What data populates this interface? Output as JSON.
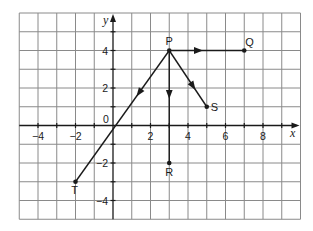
{
  "diagram": {
    "type": "coordinate-grid-vectors",
    "grid": {
      "x_min": -5,
      "x_max": 10,
      "y_min": -5,
      "y_max": 6,
      "step": 1
    },
    "axes": {
      "x_label": "x",
      "y_label": "y",
      "origin_label": "0",
      "x_tick_labels": [
        {
          "value": -4,
          "text": "−4"
        },
        {
          "value": -2,
          "text": "−2"
        },
        {
          "value": 2,
          "text": "2"
        },
        {
          "value": 4,
          "text": "4"
        },
        {
          "value": 6,
          "text": "6"
        },
        {
          "value": 8,
          "text": "8"
        }
      ],
      "y_tick_labels": [
        {
          "value": 4,
          "text": "4"
        },
        {
          "value": 2,
          "text": "2"
        },
        {
          "value": -2,
          "text": "−2"
        },
        {
          "value": -4,
          "text": "−4"
        }
      ]
    },
    "points": [
      {
        "name": "P",
        "x": 3,
        "y": 4,
        "label_dx": 0,
        "label_dy": -6,
        "anchor": "middle"
      },
      {
        "name": "Q",
        "x": 7,
        "y": 4,
        "label_dx": 1,
        "label_dy": -5,
        "anchor": "start"
      },
      {
        "name": "S",
        "x": 5,
        "y": 1,
        "label_dx": 4,
        "label_dy": 4,
        "anchor": "start"
      },
      {
        "name": "R",
        "x": 3,
        "y": -2,
        "label_dx": 0,
        "label_dy": 13,
        "anchor": "middle"
      },
      {
        "name": "T",
        "x": -2,
        "y": -3,
        "label_dx": -1,
        "label_dy": 12,
        "anchor": "middle"
      }
    ],
    "vectors": [
      {
        "from": "P",
        "to": "Q",
        "arrow_at": 0.45
      },
      {
        "from": "P",
        "to": "S",
        "arrow_at": 0.7
      },
      {
        "from": "P",
        "to": "R",
        "arrow_at": 0.43
      },
      {
        "from": "P",
        "to": "T",
        "arrow_at": 0.35
      }
    ],
    "colors": {
      "grid": "#8a8a8a",
      "ink": "#1a1a1a",
      "background": "#ffffff"
    }
  }
}
